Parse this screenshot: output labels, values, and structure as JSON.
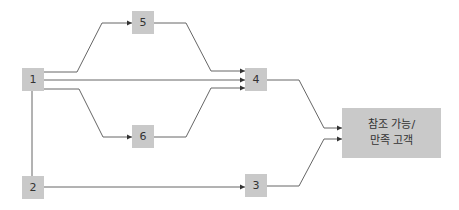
{
  "colors": {
    "node_fill": "#c9c9c9",
    "node_text": "#333333",
    "edge": "#666666",
    "background": "#ffffff"
  },
  "nodes": [
    {
      "id": "1",
      "label": "1",
      "x": 22,
      "y": 68,
      "w": 22,
      "h": 23
    },
    {
      "id": "2",
      "label": "2",
      "x": 22,
      "y": 176,
      "w": 22,
      "h": 23
    },
    {
      "id": "3",
      "label": "3",
      "x": 245,
      "y": 174,
      "w": 22,
      "h": 23
    },
    {
      "id": "4",
      "label": "4",
      "x": 245,
      "y": 68,
      "w": 22,
      "h": 23
    },
    {
      "id": "5",
      "label": "5",
      "x": 132,
      "y": 11,
      "w": 22,
      "h": 23
    },
    {
      "id": "6",
      "label": "6",
      "x": 132,
      "y": 125,
      "w": 22,
      "h": 23
    },
    {
      "id": "target",
      "label_line1": "참조 가능/",
      "label_line2": "만족 고객",
      "x": 342,
      "y": 108,
      "w": 99,
      "h": 50
    }
  ],
  "edges": [
    {
      "from": "1",
      "to": "5",
      "points": "44,72 77,72 102,23 132,23",
      "arrow": true
    },
    {
      "from": "5",
      "to": "4",
      "points": "154,23 186,23 211,71 245,71",
      "arrow": true
    },
    {
      "from": "1",
      "to": "4",
      "points": "44,80 245,80",
      "arrow": true
    },
    {
      "from": "1",
      "to": "6",
      "points": "44,89 79,89 103,137 132,137",
      "arrow": true
    },
    {
      "from": "6",
      "to": "4",
      "points": "154,137 186,137 211,88 245,88",
      "arrow": true
    },
    {
      "from": "1",
      "to": "2",
      "points": "32,91 32,176",
      "arrow": false
    },
    {
      "from": "2",
      "to": "3",
      "points": "44,187 245,187",
      "arrow": true
    },
    {
      "from": "4",
      "to": "target",
      "points": "267,80 299,80 324,128 342,128",
      "arrow": true
    },
    {
      "from": "3",
      "to": "target",
      "points": "267,186 299,186 324,139 342,139",
      "arrow": true
    }
  ]
}
